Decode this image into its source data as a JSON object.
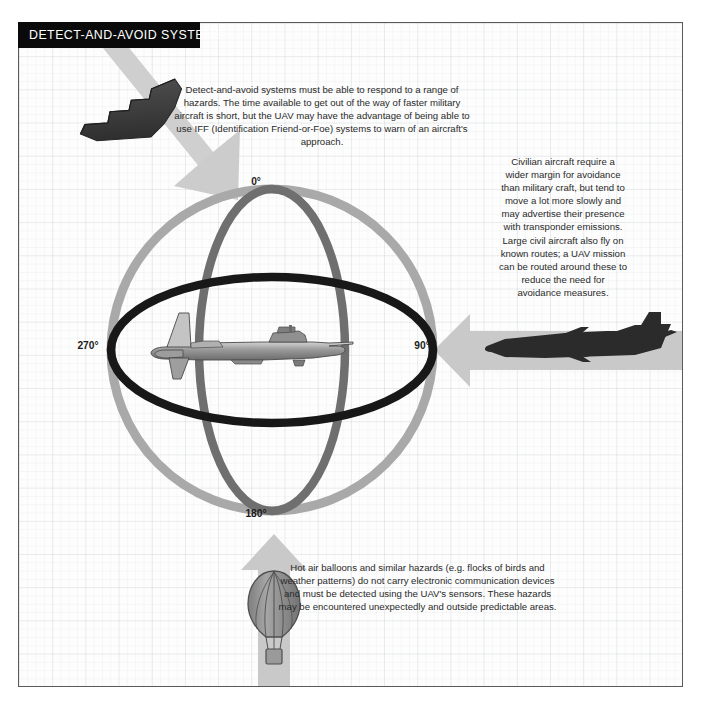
{
  "header": {
    "title": "DETECT-AND-AVOID SYSTEMS"
  },
  "text_blocks": {
    "top": "Detect-and-avoid systems must be able to respond to a range of hazards. The time available to get out of the way of faster military aircraft is short, but the UAV may have the advantage of being able to use IFF (Identification Friend-or-Foe) systems to warn of an aircraft's approach.",
    "right": "Civilian aircraft require a wider margin for avoidance than military craft, but tend to move a lot more slowly and may advertise their presence with transponder emissions. Large civil aircraft also fly on known routes; a UAV mission can be routed around these to reduce the need for avoidance measures.",
    "bottom": "Hot air balloons and similar hazards (e.g. flocks of birds and weather patterns) do not carry electronic communication devices and must be detected using the UAV's sensors. These hazards may be encountered unexpectedly and outside predictable areas."
  },
  "bearings": {
    "north": "0°",
    "east": "90°",
    "south": "180°",
    "west": "270°"
  },
  "icons": {
    "stealth_bomber": "stealth-bomber-icon",
    "airliner": "airliner-icon",
    "hot_air_balloon": "hot-air-balloon-icon",
    "uav": "uav-icon",
    "arrow_military": "arrow-down-right-icon",
    "arrow_civil": "arrow-left-icon",
    "arrow_balloon": "arrow-up-icon"
  },
  "colors": {
    "header_bg": "#0a0a0a",
    "header_text": "#ffffff",
    "panel_bg": "#fdfdfd",
    "panel_border": "#5a5a5a",
    "grid_line": "#78828c",
    "ring_outer": "#a9a9a9",
    "ring_vertical": "#6f6f6f",
    "ring_horizontal": "#181818",
    "arrow_fill": "#c9c9c9",
    "craft_dark": "#3c3c3c",
    "craft_gray": "#8e8e8e",
    "body_text": "#2a2a2a"
  }
}
